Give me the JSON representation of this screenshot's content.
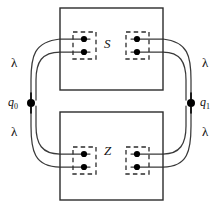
{
  "diagram": {
    "canvas": {
      "width": 222,
      "height": 208
    },
    "colors": {
      "stroke": "#2b2b2b",
      "wire": "#3a3a3a",
      "dot": "#000000",
      "text": "#111111",
      "background": "#ffffff"
    },
    "boxes": [
      {
        "id": "box-s",
        "label": "S",
        "x": 60,
        "y": 8,
        "width": 103,
        "height": 82,
        "label_x": 107,
        "label_y": 44
      },
      {
        "id": "box-z",
        "label": "Z",
        "x": 60,
        "y": 112,
        "width": 103,
        "height": 88,
        "label_x": 107,
        "label_y": 151
      }
    ],
    "registers": [
      {
        "id": "reg-s-left",
        "box": "S",
        "side": "left",
        "x": 73,
        "y": 32,
        "width": 23,
        "height": 27
      },
      {
        "id": "reg-s-right",
        "box": "S",
        "side": "right",
        "x": 126,
        "y": 32,
        "width": 23,
        "height": 27
      },
      {
        "id": "reg-z-left",
        "box": "Z",
        "side": "left",
        "x": 73,
        "y": 147,
        "width": 23,
        "height": 27
      },
      {
        "id": "reg-z-right",
        "box": "Z",
        "side": "right",
        "x": 126,
        "y": 147,
        "width": 23,
        "height": 27
      }
    ],
    "qubit_dots": [
      {
        "register": "reg-s-left",
        "cx": 84,
        "cy": 39,
        "r": 3.1
      },
      {
        "register": "reg-s-left",
        "cx": 84,
        "cy": 52,
        "r": 3.1
      },
      {
        "register": "reg-s-right",
        "cx": 137,
        "cy": 39,
        "r": 3.1
      },
      {
        "register": "reg-s-right",
        "cx": 137,
        "cy": 52,
        "r": 3.1
      },
      {
        "register": "reg-z-left",
        "cx": 84,
        "cy": 154,
        "r": 3.1
      },
      {
        "register": "reg-z-left",
        "cx": 84,
        "cy": 167,
        "r": 3.1
      },
      {
        "register": "reg-z-right",
        "cx": 137,
        "cy": 154,
        "r": 3.1
      },
      {
        "register": "reg-z-right",
        "cx": 137,
        "cy": 167,
        "r": 3.1
      }
    ],
    "nodes": [
      {
        "id": "node-q0",
        "label": "q",
        "subscript": "0",
        "cx": 31,
        "cy": 103,
        "r": 4.0,
        "label_x": 8,
        "label_y": 97
      },
      {
        "id": "node-q1",
        "label": "q",
        "subscript": "1",
        "cx": 191,
        "cy": 103,
        "r": 4.0,
        "label_x": 200,
        "label_y": 97
      }
    ],
    "lambda_labels": [
      {
        "id": "lambda-top-left",
        "text": "λ",
        "x": 11,
        "y": 63
      },
      {
        "id": "lambda-top-right",
        "text": "λ",
        "x": 202,
        "y": 63
      },
      {
        "id": "lambda-bottom-left",
        "text": "λ",
        "x": 11,
        "y": 132
      },
      {
        "id": "lambda-bottom-right",
        "text": "λ",
        "x": 202,
        "y": 132
      }
    ],
    "wires": [
      {
        "id": "wire-q0-s-outer",
        "from": "q0",
        "to": "reg-s-left",
        "d": "M 31 99 L 31 80 C 31 56 34 42 60 39 L 90 39"
      },
      {
        "id": "wire-q0-s-inner",
        "from": "q0",
        "to": "reg-s-left",
        "d": "M 36 100 L 36 80 C 36 62 42 52 60 52 L 90 52"
      },
      {
        "id": "wire-q0-z-outer",
        "from": "q0",
        "to": "reg-z-left",
        "d": "M 31 107 L 31 126 C 31 150 34 167 60 167 L 90 167"
      },
      {
        "id": "wire-q0-z-inner",
        "from": "q0",
        "to": "reg-z-left",
        "d": "M 36 106 L 36 126 C 36 144 42 154 60 154 L 90 154"
      },
      {
        "id": "wire-q1-s-outer",
        "from": "q1",
        "to": "reg-s-right",
        "d": "M 191 99 L 191 80 C 191 56 188 42 163 39 L 131 39"
      },
      {
        "id": "wire-q1-s-inner",
        "from": "q1",
        "to": "reg-s-right",
        "d": "M 186 100 L 186 80 C 186 62 180 52 163 52 L 131 52"
      },
      {
        "id": "wire-q1-z-outer",
        "from": "q1",
        "to": "reg-z-right",
        "d": "M 191 107 L 191 126 C 191 150 188 167 163 167 L 131 167"
      },
      {
        "id": "wire-q1-z-inner",
        "from": "q1",
        "to": "reg-z-right",
        "d": "M 186 106 L 186 126 C 186 144 180 154 163 154 L 131 154"
      }
    ],
    "node_ticks": [
      {
        "node": "node-q0",
        "x": 31,
        "y1": 93,
        "y2": 99
      },
      {
        "node": "node-q0",
        "x": 31,
        "y1": 107,
        "y2": 113
      },
      {
        "node": "node-q1",
        "x": 191,
        "y1": 93,
        "y2": 99
      },
      {
        "node": "node-q1",
        "x": 191,
        "y1": 107,
        "y2": 113
      }
    ]
  }
}
